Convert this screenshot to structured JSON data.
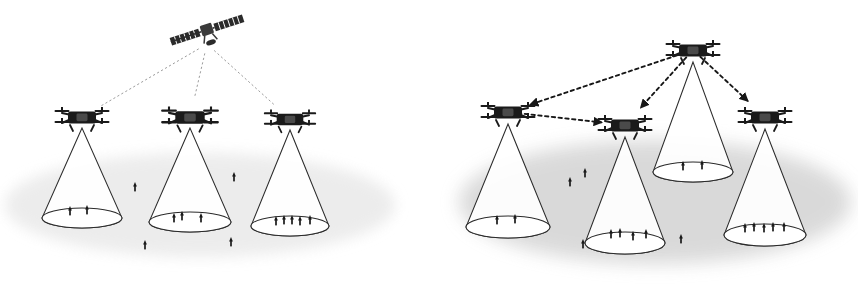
{
  "figure": {
    "type": "diagram",
    "title": "",
    "width": 858,
    "height": 284,
    "background": "#ffffff",
    "style": {
      "ink": "#1a1a1a",
      "line": "#3a3a3a",
      "ground_left": "#e9e9e9",
      "ground_right": "#d8d8d8",
      "cone_stroke": "#2b2b2b",
      "link_dotted": "#8a8a8a",
      "link_dashed": "#171717"
    },
    "panels": [
      {
        "id": "left",
        "name": "satellite-relay-scenario",
        "label": "",
        "ground": {
          "cx": 200,
          "cy": 205,
          "rx": 195,
          "ry": 52,
          "fill": "#e9e9e9",
          "opacity": 0.85
        },
        "satellite": {
          "name": "satellite",
          "x": 207,
          "y": 30,
          "body_w": 12,
          "body_h": 10,
          "panel_w": 30,
          "panel_h": 8,
          "tilt_deg": -18
        },
        "drones": [
          {
            "id": "L1",
            "x": 82,
            "y": 117,
            "scale": 1.0,
            "users": 2
          },
          {
            "id": "L2",
            "x": 190,
            "y": 117,
            "scale": 1.05,
            "users": 3
          },
          {
            "id": "L3",
            "x": 290,
            "y": 119,
            "scale": 0.95,
            "users": 5
          }
        ],
        "cones": [
          {
            "id": "C-L1",
            "apex_x": 82,
            "apex_y": 128,
            "cx": 82,
            "cy": 218,
            "rx": 40,
            "ry": 10
          },
          {
            "id": "C-L2",
            "apex_x": 190,
            "apex_y": 128,
            "cx": 190,
            "cy": 222,
            "rx": 41,
            "ry": 10
          },
          {
            "id": "C-L3",
            "apex_x": 290,
            "apex_y": 130,
            "cx": 290,
            "cy": 226,
            "rx": 39,
            "ry": 10
          }
        ],
        "links": [
          {
            "from": "satellite",
            "to": "L1",
            "style": "dotted",
            "arrow": false
          },
          {
            "from": "satellite",
            "to": "L2",
            "style": "dotted",
            "arrow": false
          },
          {
            "from": "satellite",
            "to": "L3",
            "style": "dotted",
            "arrow": false
          }
        ],
        "covered_users": [
          {
            "x": 70,
            "y": 215
          },
          {
            "x": 87,
            "y": 214
          },
          {
            "x": 174,
            "y": 222
          },
          {
            "x": 182,
            "y": 220
          },
          {
            "x": 201,
            "y": 222
          },
          {
            "x": 276,
            "y": 225
          },
          {
            "x": 284,
            "y": 224
          },
          {
            "x": 292,
            "y": 224
          },
          {
            "x": 300,
            "y": 225
          },
          {
            "x": 310,
            "y": 224
          }
        ],
        "uncovered_users": [
          {
            "x": 135,
            "y": 191
          },
          {
            "x": 234,
            "y": 181
          },
          {
            "x": 145,
            "y": 249
          },
          {
            "x": 231,
            "y": 246
          }
        ]
      },
      {
        "id": "right",
        "name": "uav-relay-mesh-scenario",
        "label": "",
        "ground": {
          "cx": 655,
          "cy": 202,
          "rx": 196,
          "ry": 62,
          "fill": "#d8d8d8",
          "opacity": 0.95
        },
        "satellite": null,
        "drones": [
          {
            "id": "R0",
            "x": 693,
            "y": 50,
            "scale": 1.0,
            "users": 2,
            "role": "relay-hub"
          },
          {
            "id": "R1",
            "x": 508,
            "y": 112,
            "scale": 1.0,
            "users": 2
          },
          {
            "id": "R2",
            "x": 625,
            "y": 125,
            "scale": 1.0,
            "users": 4
          },
          {
            "id": "R3",
            "x": 765,
            "y": 117,
            "scale": 1.0,
            "users": 5
          }
        ],
        "cones": [
          {
            "id": "C-R0",
            "apex_x": 693,
            "apex_y": 62,
            "cx": 693,
            "cy": 172,
            "rx": 40,
            "ry": 10
          },
          {
            "id": "C-R1",
            "apex_x": 508,
            "apex_y": 124,
            "cx": 508,
            "cy": 227,
            "rx": 42,
            "ry": 11
          },
          {
            "id": "C-R2",
            "apex_x": 625,
            "apex_y": 137,
            "cx": 625,
            "cy": 243,
            "rx": 40,
            "ry": 11
          },
          {
            "id": "C-R3",
            "apex_x": 765,
            "apex_y": 129,
            "cx": 765,
            "cy": 235,
            "rx": 41,
            "ry": 11
          }
        ],
        "links": [
          {
            "from": "R0",
            "to": "R1",
            "style": "dashed",
            "arrow": true
          },
          {
            "from": "R1",
            "to": "R2",
            "style": "dashed",
            "arrow": true
          },
          {
            "from": "R0",
            "to": "R2",
            "style": "dashed",
            "arrow": true
          },
          {
            "from": "R0",
            "to": "R3",
            "style": "dashed",
            "arrow": true
          }
        ],
        "covered_users": [
          {
            "x": 683,
            "y": 170
          },
          {
            "x": 702,
            "y": 169
          },
          {
            "x": 497,
            "y": 224
          },
          {
            "x": 515,
            "y": 223
          },
          {
            "x": 611,
            "y": 238
          },
          {
            "x": 620,
            "y": 237
          },
          {
            "x": 633,
            "y": 240
          },
          {
            "x": 646,
            "y": 238
          },
          {
            "x": 745,
            "y": 232
          },
          {
            "x": 754,
            "y": 231
          },
          {
            "x": 764,
            "y": 232
          },
          {
            "x": 773,
            "y": 231
          },
          {
            "x": 784,
            "y": 231
          }
        ],
        "uncovered_users": [
          {
            "x": 585,
            "y": 177
          },
          {
            "x": 570,
            "y": 186
          },
          {
            "x": 681,
            "y": 243
          },
          {
            "x": 583,
            "y": 248
          }
        ]
      }
    ],
    "legend_semantics": {
      "drone": "quadcopter-uav",
      "satellite": "communications-satellite",
      "cone": "uav-coverage-footprint",
      "arrow_mark": "ground-user-terminal",
      "dotted_line": "satellite-to-uav-backhaul-link",
      "dashed_line": "uav-to-uav-relay-link"
    }
  }
}
